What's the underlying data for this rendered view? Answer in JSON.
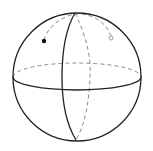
{
  "diagram": {
    "type": "sphere",
    "background": "#ffffff",
    "stroke_color": "#222222",
    "hidden_stroke_color": "#8a8a8a",
    "elements": [
      {
        "name": "sphere-outline",
        "style": "solid"
      },
      {
        "name": "equator-front",
        "style": "solid"
      },
      {
        "name": "equator-back",
        "style": "dashed"
      },
      {
        "name": "meridian-front",
        "style": "solid"
      },
      {
        "name": "meridian-back",
        "style": "dashed"
      },
      {
        "name": "geodesic-path",
        "style": "dashed"
      },
      {
        "name": "start-point",
        "style": "filled-dot"
      },
      {
        "name": "end-point",
        "style": "open-dot"
      }
    ]
  }
}
